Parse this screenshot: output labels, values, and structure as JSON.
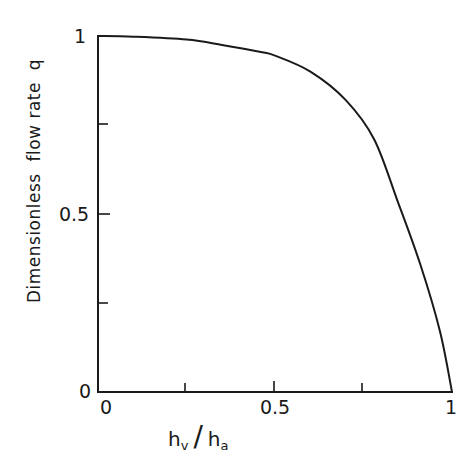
{
  "chart_data": {
    "type": "line",
    "title": "",
    "xlabel": "h_v / h_a",
    "ylabel": "Dimensionless flow rate q",
    "xlim": [
      0,
      1
    ],
    "ylim": [
      0,
      1
    ],
    "grid": false,
    "legend": null,
    "x_ticks": [
      0,
      0.25,
      0.5,
      0.75,
      1
    ],
    "x_tick_labels": [
      "0",
      "",
      "0.5",
      "",
      "1"
    ],
    "y_ticks": [
      0,
      0.25,
      0.5,
      0.75,
      1
    ],
    "y_tick_labels": [
      "0",
      "",
      "0.5",
      "",
      "1"
    ],
    "series": [
      {
        "name": "q",
        "x": [
          0,
          0.1,
          0.25,
          0.35,
          0.46,
          0.5,
          0.6,
          0.7,
          0.78,
          0.845,
          0.91,
          0.966,
          1.0
        ],
        "y": [
          1.0,
          0.998,
          0.99,
          0.975,
          0.955,
          0.945,
          0.9,
          0.82,
          0.71,
          0.54,
          0.36,
          0.17,
          0.0
        ]
      }
    ]
  },
  "labels": {
    "y_axis_title": "Dimensionless  flow rate  q",
    "x_axis_title_main1": "h",
    "x_axis_title_sub1": "v",
    "x_axis_title_slash": "/",
    "x_axis_title_main2": "h",
    "x_axis_title_sub2": "a",
    "y_tick_0": "0",
    "y_tick_05": "0.5",
    "y_tick_1": "1",
    "x_tick_0": "0",
    "x_tick_05": "0.5",
    "x_tick_1": "1"
  },
  "colors": {
    "line": "#1a1a1a",
    "background": "#ffffff"
  }
}
